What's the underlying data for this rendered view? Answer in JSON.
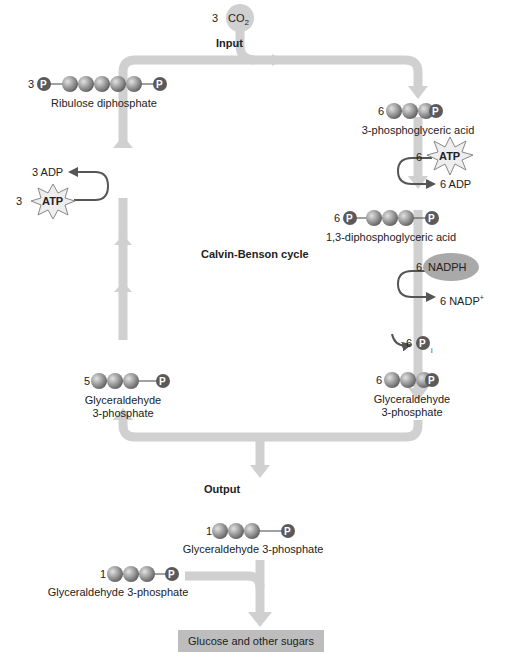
{
  "diagram": {
    "title": "Calvin-Benson cycle",
    "input": {
      "label": "Input",
      "count": "3",
      "molecule": "CO",
      "subscript": "2"
    },
    "output": {
      "label": "Output"
    },
    "molecules": {
      "ribulose": {
        "count": "3",
        "label": "Ribulose diphosphate"
      },
      "pga": {
        "count": "6",
        "label": "3-phosphoglyceric acid"
      },
      "dpga": {
        "count": "6",
        "label": "1,3-diphosphoglyceric acid"
      },
      "g3p_right": {
        "count": "6",
        "label_line1": "Glyceraldehyde",
        "label_line2": "3-phosphate"
      },
      "g3p_left": {
        "count": "5",
        "label_line1": "Glyceraldehyde",
        "label_line2": "3-phosphate"
      },
      "g3p_out1": {
        "count": "1",
        "label": "Glyceraldehyde 3-phosphate"
      },
      "g3p_out2": {
        "count": "1",
        "label": "Glyceraldehyde 3-phosphate"
      }
    },
    "cofactors": {
      "atp_right": {
        "count": "6",
        "label": "ATP"
      },
      "adp_right": {
        "label": "6 ADP"
      },
      "nadph": {
        "count": "6",
        "label": "NADPH"
      },
      "nadp": {
        "label": "6 NADP",
        "superscript": "+"
      },
      "pi": {
        "count": "6",
        "label": "P",
        "subscript": "i"
      },
      "adp_left": {
        "label": "3 ADP"
      },
      "atp_left": {
        "count": "3",
        "label": "ATP"
      }
    },
    "phosphate_symbol": "P",
    "product": "Glucose and other sugars",
    "colors": {
      "flow_arrow": "#cfcfcf",
      "carbon_ball": "#8a8a8a",
      "phosphate": "#5a5a5a",
      "curve_arrow": "#555555",
      "nadph_oval": "#a9a9a9",
      "atp_star": "#eeeeee",
      "product_box": "#bdbdbd"
    }
  }
}
